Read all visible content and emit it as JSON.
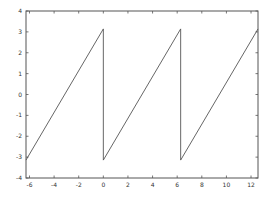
{
  "chart_data": {
    "type": "line",
    "title": "",
    "xlabel": "",
    "ylabel": "",
    "xlim": [
      -6.2832,
      12.5664
    ],
    "ylim": [
      -4,
      4
    ],
    "grid": false,
    "legend": "none",
    "xticks": [
      -6,
      -4,
      -2,
      0,
      2,
      4,
      6,
      8,
      10,
      12
    ],
    "xtick_labels": [
      "-6",
      "-4",
      "-2",
      "0",
      "2",
      "4",
      "6",
      "8",
      "10",
      "12"
    ],
    "yticks": [
      -4,
      -3,
      -2,
      -1,
      0,
      1,
      2,
      3,
      4
    ],
    "ytick_labels": [
      "-4",
      "-3",
      "-2",
      "-1",
      "0",
      "1",
      "2",
      "3",
      "4"
    ],
    "series": [
      {
        "name": "sawtooth",
        "color": "#555555",
        "x": [
          -6.2832,
          0,
          0,
          6.2832,
          6.2832,
          12.5664
        ],
        "y": [
          -3.1416,
          3.1416,
          -3.1416,
          3.1416,
          -3.1416,
          3.1416
        ]
      }
    ]
  }
}
